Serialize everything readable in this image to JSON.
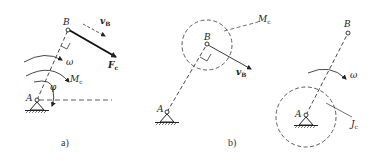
{
  "figure": {
    "panels": [
      {
        "id": "a",
        "caption": "a)",
        "labels": {
          "point_A": "A",
          "point_B": "B",
          "velocity": "v",
          "velocity_sub": "B",
          "force": "F",
          "force_sub": "c",
          "angular_velocity": "ω",
          "moment": "M",
          "moment_sub": "c",
          "angle": "φ"
        }
      },
      {
        "id": "b",
        "caption": "b)",
        "labels": {
          "point_A": "A",
          "point_B": "B",
          "velocity": "v",
          "velocity_sub": "B",
          "moment": "M",
          "moment_sub": "c"
        }
      },
      {
        "id": "c",
        "caption": "",
        "labels": {
          "point_A": "A",
          "point_B": "B",
          "angular_velocity": "ω",
          "inertia": "J",
          "inertia_sub": "c"
        }
      }
    ],
    "colors": {
      "ink": "#222222",
      "background": "#ffffff"
    }
  }
}
